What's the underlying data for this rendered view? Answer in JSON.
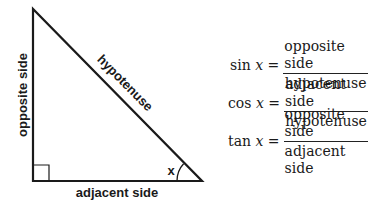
{
  "diagram": {
    "type": "right-triangle",
    "labels": {
      "opposite": "opposite side",
      "hypotenuse": "hypotenuse",
      "adjacent": "adjacent side",
      "angle": "x"
    },
    "colors": {
      "stroke": "#1a1a1a",
      "text": "#1a1a1a",
      "background": "#ffffff"
    }
  },
  "formulas": [
    {
      "fn": "sin",
      "var": "x",
      "eq": "=",
      "numerator": "opposite side",
      "denominator": "hypotenuse"
    },
    {
      "fn": "cos",
      "var": "x",
      "eq": "=",
      "numerator": "adjacent side",
      "denominator": "hypotenuse"
    },
    {
      "fn": "tan",
      "var": "x",
      "eq": "=",
      "numerator": "opposite side",
      "denominator": "adjacent side"
    }
  ]
}
